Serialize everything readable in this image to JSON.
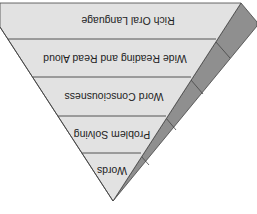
{
  "diagram": {
    "orientation": "rotated-180",
    "colors": {
      "front_face": "#e2e2e2",
      "side_face": "#8f8f8f",
      "edge": "#444444",
      "text": "#222222",
      "background": "#ffffff"
    },
    "layers": [
      {
        "label": "Rich Oral Language"
      },
      {
        "label": "Wide Reading and Read Aloud"
      },
      {
        "label": "Word Consciousness"
      },
      {
        "label": "Problem Solving"
      },
      {
        "label": "Words"
      }
    ]
  }
}
